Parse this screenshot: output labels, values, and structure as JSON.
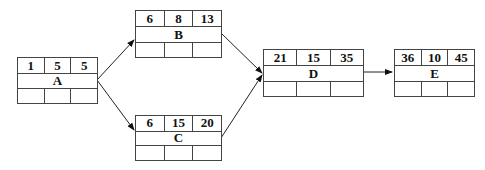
{
  "diagram": {
    "type": "activity-on-node network",
    "nodes": [
      {
        "id": "A",
        "label": "A",
        "top": [
          "1",
          "5",
          "5"
        ],
        "bottom": [
          "",
          "",
          ""
        ]
      },
      {
        "id": "B",
        "label": "B",
        "top": [
          "6",
          "8",
          "13"
        ],
        "bottom": [
          "",
          "",
          ""
        ]
      },
      {
        "id": "C",
        "label": "C",
        "top": [
          "6",
          "15",
          "20"
        ],
        "bottom": [
          "",
          "",
          ""
        ]
      },
      {
        "id": "D",
        "label": "D",
        "top": [
          "21",
          "15",
          "35"
        ],
        "bottom": [
          "",
          "",
          ""
        ]
      },
      {
        "id": "E",
        "label": "E",
        "top": [
          "36",
          "10",
          "45"
        ],
        "bottom": [
          "",
          "",
          ""
        ]
      }
    ],
    "edges": [
      {
        "from": "A",
        "to": "B"
      },
      {
        "from": "A",
        "to": "C"
      },
      {
        "from": "B",
        "to": "D"
      },
      {
        "from": "C",
        "to": "D"
      },
      {
        "from": "D",
        "to": "E"
      }
    ]
  }
}
